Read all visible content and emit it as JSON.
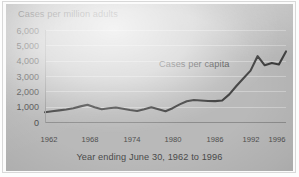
{
  "chart_data": {
    "type": "line",
    "title": "",
    "subtitle": "",
    "xlabel": "Year ending June 30, 1962 to 1996",
    "ylabel": "Cases per million adults",
    "grid": true,
    "legend_position": "inline-annotation",
    "xlim": [
      1962,
      1996
    ],
    "ylim": [
      0,
      6000
    ],
    "yticks": [
      0,
      1000,
      2000,
      3000,
      4000,
      5000,
      6000
    ],
    "ytick_labels": [
      "0",
      "1,000",
      "2,000",
      "3,000",
      "4,000",
      "5,000",
      "6,000"
    ],
    "xticks": [
      1962,
      1968,
      1974,
      1980,
      1986,
      1992,
      1996
    ],
    "xtick_labels": [
      "1962",
      "1968",
      "1974",
      "1980",
      "1986",
      "1992",
      "1996"
    ],
    "annotations": [
      {
        "text": "Cases per capita",
        "x": 1986,
        "y": 4000
      }
    ],
    "series": [
      {
        "name": "Cases per capita",
        "color": "#3d3d3d",
        "x": [
          1962,
          1963,
          1964,
          1965,
          1966,
          1967,
          1968,
          1969,
          1970,
          1971,
          1972,
          1973,
          1974,
          1975,
          1976,
          1977,
          1978,
          1979,
          1980,
          1981,
          1982,
          1983,
          1984,
          1985,
          1986,
          1987,
          1988,
          1989,
          1990,
          1991,
          1992,
          1993,
          1994,
          1995,
          1996
        ],
        "values": [
          640,
          700,
          760,
          820,
          900,
          1020,
          1120,
          960,
          830,
          900,
          950,
          860,
          780,
          720,
          830,
          960,
          830,
          700,
          900,
          1150,
          1350,
          1430,
          1400,
          1370,
          1360,
          1400,
          1800,
          2350,
          2850,
          3350,
          4300,
          3700,
          3850,
          3750,
          4600
        ]
      }
    ]
  },
  "axis": {
    "y_title": "Cases per million adults",
    "x_title": "Year ending June 30, 1962 to 1996"
  },
  "annotation": {
    "series_label": "Cases per capita"
  },
  "colors": {
    "panel_background": "#b9b9b9",
    "gridline": "#cfcfcf",
    "line": "#3d3d3d",
    "text": "#4a4a4a",
    "page_background": "#ffffff"
  }
}
